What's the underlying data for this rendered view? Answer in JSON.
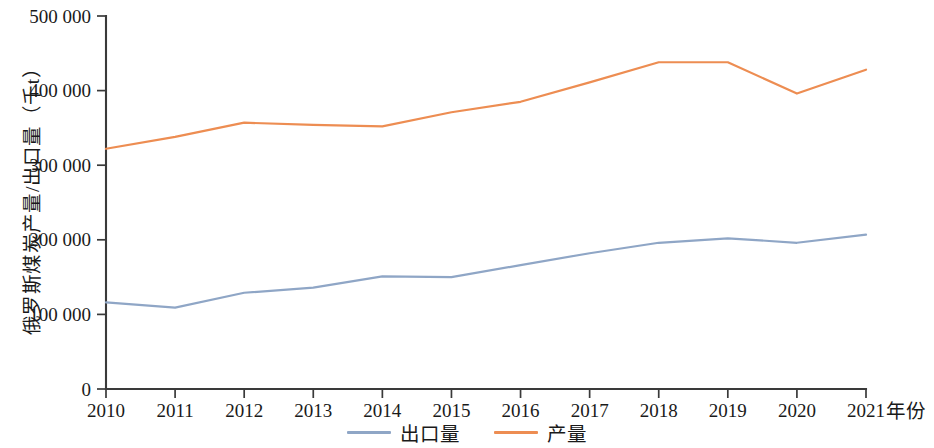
{
  "chart_data": {
    "type": "line",
    "title": "",
    "xlabel": "年份",
    "ylabel": "俄罗斯煤炭产量/出口量（千t）",
    "categories": [
      "2010",
      "2011",
      "2012",
      "2013",
      "2014",
      "2015",
      "2016",
      "2017",
      "2018",
      "2019",
      "2020",
      "2021"
    ],
    "x": [
      2010,
      2011,
      2012,
      2013,
      2014,
      2015,
      2016,
      2017,
      2018,
      2019,
      2020,
      2021
    ],
    "xlim": [
      2010,
      2021
    ],
    "ylim": [
      0,
      500000
    ],
    "yticks": [
      0,
      100000,
      200000,
      300000,
      400000,
      500000
    ],
    "ytick_labels": [
      "0",
      "100 000",
      "200 000",
      "300 000",
      "400 000",
      "500 000"
    ],
    "xtick_labels": [
      "2010",
      "2011",
      "2012",
      "2013",
      "2014",
      "2015",
      "2016",
      "2017",
      "2018",
      "2019",
      "2020",
      "2021"
    ],
    "grid": false,
    "legend_position": "bottom-center",
    "series": [
      {
        "name": "出口量",
        "color": "#8FA6C6",
        "values": [
          116000,
          109000,
          129000,
          136000,
          151000,
          150000,
          166000,
          182000,
          196000,
          202000,
          196000,
          207000
        ]
      },
      {
        "name": "产量",
        "color": "#ED8D52",
        "values": [
          322000,
          338000,
          357000,
          354000,
          352000,
          371000,
          385000,
          411000,
          438000,
          438000,
          396000,
          428000
        ]
      }
    ]
  },
  "axes": {
    "y_title": "俄罗斯煤炭产量/出口量（千t）",
    "x_title": "年份"
  },
  "legend": {
    "items": [
      {
        "label": "出口量",
        "color": "#8FA6C6"
      },
      {
        "label": "产量",
        "color": "#ED8D52"
      }
    ]
  }
}
